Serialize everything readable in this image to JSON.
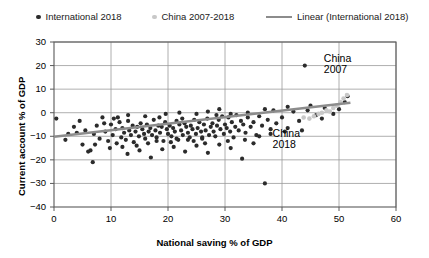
{
  "chart_data": {
    "type": "scatter",
    "title": "",
    "xlabel": "National saving % of GDP",
    "ylabel": "Current account % of GDP",
    "xlim": [
      0,
      60
    ],
    "ylim": [
      -40,
      30
    ],
    "xticks": [
      0,
      10,
      20,
      30,
      40,
      50,
      60
    ],
    "yticks": [
      -40,
      -30,
      -20,
      -10,
      0,
      10,
      20,
      30
    ],
    "grid": true,
    "legend_position": "top",
    "legend": [
      {
        "label": "International 2018",
        "marker": "dot",
        "color": "#2b2b2b"
      },
      {
        "label": "China 2007-2018",
        "marker": "dot",
        "color": "#c8c8c8"
      },
      {
        "label": "Linear (International 2018)",
        "marker": "line",
        "color": "#8c8c8c"
      }
    ],
    "annotations": [
      {
        "text_line1": "China",
        "text_line2": "2007",
        "x": 50.5,
        "y": 23
      },
      {
        "text_line1": "China",
        "text_line2": "2018",
        "x": 41.5,
        "y": -9
      }
    ],
    "series": [
      {
        "name": "International 2018",
        "color": "#2b2b2b",
        "points": [
          [
            0.4,
            -2.5
          ],
          [
            2.5,
            -9.0
          ],
          [
            4.0,
            -8.5
          ],
          [
            5.0,
            -13.5
          ],
          [
            5.5,
            -7.5
          ],
          [
            6.0,
            -16.5
          ],
          [
            6.4,
            -16.0
          ],
          [
            7.0,
            -9.0
          ],
          [
            7.5,
            -5.5
          ],
          [
            8.0,
            -11.0
          ],
          [
            8.5,
            -2.0
          ],
          [
            9.0,
            -8.0
          ],
          [
            9.5,
            -12.0
          ],
          [
            10.0,
            -5.0
          ],
          [
            10.3,
            -9.5
          ],
          [
            10.8,
            -7.0
          ],
          [
            11.0,
            -13.0
          ],
          [
            11.5,
            -4.0
          ],
          [
            11.8,
            -10.5
          ],
          [
            12.0,
            -6.5
          ],
          [
            12.3,
            -8.5
          ],
          [
            12.6,
            -11.5
          ],
          [
            13.0,
            -3.5
          ],
          [
            13.2,
            -7.5
          ],
          [
            13.5,
            -9.5
          ],
          [
            13.8,
            -5.5
          ],
          [
            14.0,
            -12.5
          ],
          [
            14.3,
            -8.0
          ],
          [
            14.6,
            -6.0
          ],
          [
            14.9,
            -10.0
          ],
          [
            15.2,
            -4.5
          ],
          [
            15.5,
            -7.0
          ],
          [
            15.8,
            -9.0
          ],
          [
            16.0,
            -11.0
          ],
          [
            16.3,
            -5.0
          ],
          [
            16.6,
            -8.0
          ],
          [
            16.9,
            -6.5
          ],
          [
            17.2,
            -9.5
          ],
          [
            17.5,
            -3.0
          ],
          [
            17.8,
            -7.5
          ],
          [
            18.0,
            -10.5
          ],
          [
            18.3,
            -5.5
          ],
          [
            18.6,
            -8.5
          ],
          [
            18.9,
            -6.0
          ],
          [
            19.2,
            -12.0
          ],
          [
            19.5,
            -4.0
          ],
          [
            19.8,
            -7.0
          ],
          [
            20.0,
            -9.0
          ],
          [
            20.3,
            -5.5
          ],
          [
            20.6,
            -10.0
          ],
          [
            20.9,
            -6.5
          ],
          [
            21.2,
            -8.0
          ],
          [
            21.5,
            -3.5
          ],
          [
            21.8,
            -11.5
          ],
          [
            22.0,
            -5.0
          ],
          [
            22.3,
            -7.5
          ],
          [
            22.6,
            -9.5
          ],
          [
            22.9,
            -4.5
          ],
          [
            23.2,
            -6.0
          ],
          [
            23.5,
            -8.5
          ],
          [
            23.8,
            -10.5
          ],
          [
            24.0,
            -5.5
          ],
          [
            24.3,
            -7.0
          ],
          [
            24.6,
            -3.0
          ],
          [
            24.9,
            -9.0
          ],
          [
            25.2,
            -6.5
          ],
          [
            25.5,
            -4.0
          ],
          [
            25.8,
            -8.0
          ],
          [
            26.0,
            -11.0
          ],
          [
            26.3,
            -5.0
          ],
          [
            26.6,
            -7.5
          ],
          [
            26.9,
            -2.5
          ],
          [
            27.2,
            -9.5
          ],
          [
            27.5,
            -6.0
          ],
          [
            27.8,
            -4.5
          ],
          [
            28.0,
            -8.0
          ],
          [
            28.3,
            -10.0
          ],
          [
            28.6,
            -5.5
          ],
          [
            28.9,
            -3.0
          ],
          [
            29.2,
            -7.0
          ],
          [
            29.5,
            -1.5
          ],
          [
            29.8,
            -9.0
          ],
          [
            30.0,
            -5.0
          ],
          [
            30.3,
            -6.5
          ],
          [
            30.6,
            -2.0
          ],
          [
            30.9,
            -8.0
          ],
          [
            31.2,
            -4.0
          ],
          [
            31.5,
            -10.5
          ],
          [
            31.8,
            -6.0
          ],
          [
            32.0,
            -1.0
          ],
          [
            32.4,
            -7.5
          ],
          [
            32.8,
            -3.5
          ],
          [
            33.2,
            -5.0
          ],
          [
            33.6,
            -8.5
          ],
          [
            34.0,
            -2.0
          ],
          [
            34.5,
            -6.0
          ],
          [
            35.0,
            -4.0
          ],
          [
            35.5,
            -9.5
          ],
          [
            36.0,
            -1.5
          ],
          [
            36.5,
            -5.5
          ],
          [
            37.0,
            -30.0
          ],
          [
            37.5,
            -3.0
          ],
          [
            38.0,
            -7.0
          ],
          [
            38.5,
            1.0
          ],
          [
            39.0,
            -4.5
          ],
          [
            40.0,
            -2.0
          ],
          [
            41.0,
            -6.5
          ],
          [
            42.0,
            0.5
          ],
          [
            43.0,
            -3.5
          ],
          [
            44.0,
            20.0
          ],
          [
            45.0,
            3.0
          ],
          [
            46.0,
            -1.0
          ],
          [
            47.5,
            2.0
          ],
          [
            49.0,
            -0.5
          ],
          [
            51.0,
            4.5
          ],
          [
            6.8,
            -21.0
          ],
          [
            12.9,
            -17.5
          ],
          [
            15.0,
            -16.0
          ],
          [
            17.0,
            -19.0
          ],
          [
            19.0,
            -15.5
          ],
          [
            21.0,
            -14.5
          ],
          [
            23.0,
            -16.5
          ],
          [
            25.0,
            -14.0
          ],
          [
            27.0,
            -17.0
          ],
          [
            29.0,
            -13.5
          ],
          [
            31.0,
            -15.0
          ],
          [
            33.0,
            -19.5
          ],
          [
            35.0,
            -13.0
          ],
          [
            2.0,
            -11.5
          ],
          [
            3.5,
            -6.0
          ],
          [
            8.8,
            -4.5
          ],
          [
            10.5,
            -2.5
          ],
          [
            13.0,
            -1.0
          ],
          [
            16.0,
            -1.5
          ],
          [
            18.5,
            -2.0
          ],
          [
            20.5,
            -12.5
          ],
          [
            22.5,
            -2.5
          ],
          [
            24.5,
            -12.0
          ],
          [
            26.5,
            -13.0
          ],
          [
            28.5,
            -1.0
          ],
          [
            30.5,
            -12.0
          ],
          [
            4.5,
            -3.5
          ],
          [
            7.2,
            -13.5
          ],
          [
            9.8,
            -15.0
          ],
          [
            11.2,
            -2.0
          ],
          [
            14.5,
            -14.0
          ],
          [
            33.5,
            -11.5
          ],
          [
            36.0,
            -10.0
          ],
          [
            38.0,
            -9.0
          ],
          [
            40.5,
            -8.0
          ],
          [
            43.5,
            -7.5
          ],
          [
            19.6,
            -0.5
          ],
          [
            22.0,
            0.0
          ],
          [
            25.0,
            -0.5
          ],
          [
            27.0,
            0.5
          ],
          [
            29.0,
            1.5
          ],
          [
            31.0,
            -0.5
          ],
          [
            34.0,
            0.0
          ],
          [
            37.0,
            1.5
          ],
          [
            41.0,
            2.5
          ],
          [
            44.5,
            1.0
          ],
          [
            47.0,
            -2.5
          ],
          [
            50.0,
            1.5
          ],
          [
            51.5,
            7.0
          ],
          [
            12.0,
            -14.5
          ],
          [
            16.5,
            -13.0
          ],
          [
            18.0,
            -12.0
          ],
          [
            21.5,
            -11.0
          ],
          [
            23.5,
            -11.5
          ],
          [
            26.0,
            -10.5
          ]
        ]
      },
      {
        "name": "China 2007-2018",
        "color": "#c8c8c8",
        "points": [
          [
            43.8,
            -2.0
          ],
          [
            44.8,
            -2.5
          ],
          [
            45.6,
            -1.5
          ],
          [
            46.4,
            -0.5
          ],
          [
            47.0,
            0.0
          ],
          [
            47.8,
            1.0
          ],
          [
            48.4,
            0.5
          ],
          [
            49.0,
            2.0
          ],
          [
            49.6,
            3.0
          ],
          [
            50.2,
            4.5
          ],
          [
            50.8,
            6.0
          ],
          [
            51.4,
            7.5
          ]
        ]
      }
    ],
    "trendline": {
      "name": "Linear (International 2018)",
      "color": "#8c8c8c",
      "x0": 0,
      "y0": -10.2,
      "x1": 52.0,
      "y1": 4.2
    }
  }
}
